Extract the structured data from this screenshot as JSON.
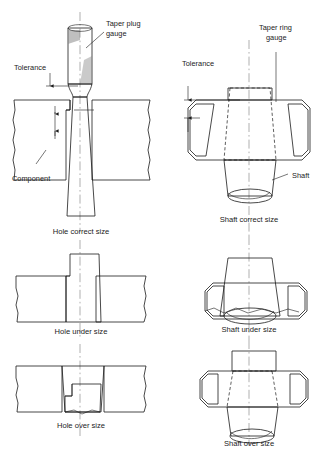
{
  "figure": {
    "columns": [
      {
        "name": "left-column",
        "subject": "Hole / Taper plug gauge"
      },
      {
        "name": "right-column",
        "subject": "Shaft / Taper ring gauge"
      }
    ]
  },
  "labels": {
    "taper_plug_gauge": "Taper plug\ngauge",
    "taper_plug_gauge_line1": "Taper plug",
    "taper_plug_gauge_line2": "gauge",
    "taper_ring_gauge_line1": "Taper ring",
    "taper_ring_gauge_line2": "gauge",
    "tolerance_left": "Tolerance",
    "tolerance_right": "Tolerance",
    "component": "Component",
    "shaft": "Shaft"
  },
  "captions": {
    "hole_correct": "Hole correct size",
    "hole_under": "Hole under size",
    "hole_over": "Hole over size",
    "shaft_correct": "Shaft correct size",
    "shaft_under": "Shaft under size",
    "shaft_over": "Shaft over size"
  },
  "colors": {
    "background": "#ffffff",
    "line": "#1b1b1b",
    "fill_grey": "#d0d0d0",
    "fill_white": "#ffffff",
    "centerline": "#8e8e8e",
    "hatch": "#4a4a4a"
  },
  "icons": {
    "centerline": "centerline-dashdot-icon",
    "hatching": "section-hatch-icon",
    "arrow": "dimension-arrow-icon",
    "leader": "leader-line-icon"
  }
}
